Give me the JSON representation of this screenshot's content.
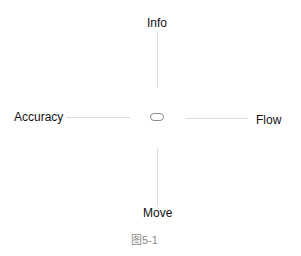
{
  "diagram": {
    "center_icon": "rounded-pill-icon",
    "directions": {
      "top": "Info",
      "left": "Accuracy",
      "right": "Flow",
      "bottom": "Move"
    },
    "caption": "图5-1",
    "colors": {
      "text": "#111111",
      "connector": "#dcdcdc",
      "center_outline": "#8a8a8a",
      "caption": "#8a8a8a"
    }
  }
}
